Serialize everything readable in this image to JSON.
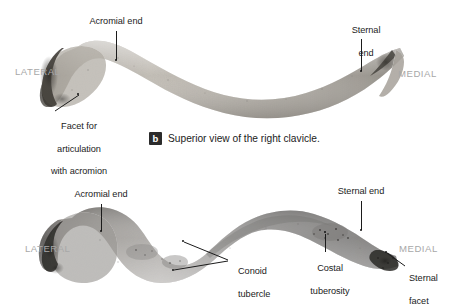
{
  "figure": {
    "subject": "right clavicle",
    "background_color": "#ffffff",
    "label_color": "#1b1b1b",
    "side_label_color": "#a8a8a8",
    "badge_color": "#2b2b2b"
  },
  "panel_superior": {
    "caption_badge": "b",
    "caption_text": "Superior view of the right clavicle.",
    "side_left": "LATERAL",
    "side_right": "MEDIAL",
    "labels": {
      "acromial_end": "Acromial end",
      "sternal_end_line1": "Sternal",
      "sternal_end_line2": "end",
      "facet_line1": "Facet for",
      "facet_line2": "articulation",
      "facet_line3": "with acromion"
    }
  },
  "panel_inferior": {
    "side_left": "LATERAL",
    "side_right": "MEDIAL",
    "labels": {
      "acromial_end": "Acromial end",
      "sternal_end": "Sternal end",
      "conoid_line1": "Conoid",
      "conoid_line2": "tubercle",
      "costal_line1": "Costal",
      "costal_line2": "tuberosity",
      "sternal_facet_line1": "Sternal",
      "sternal_facet_line2": "facet"
    }
  }
}
